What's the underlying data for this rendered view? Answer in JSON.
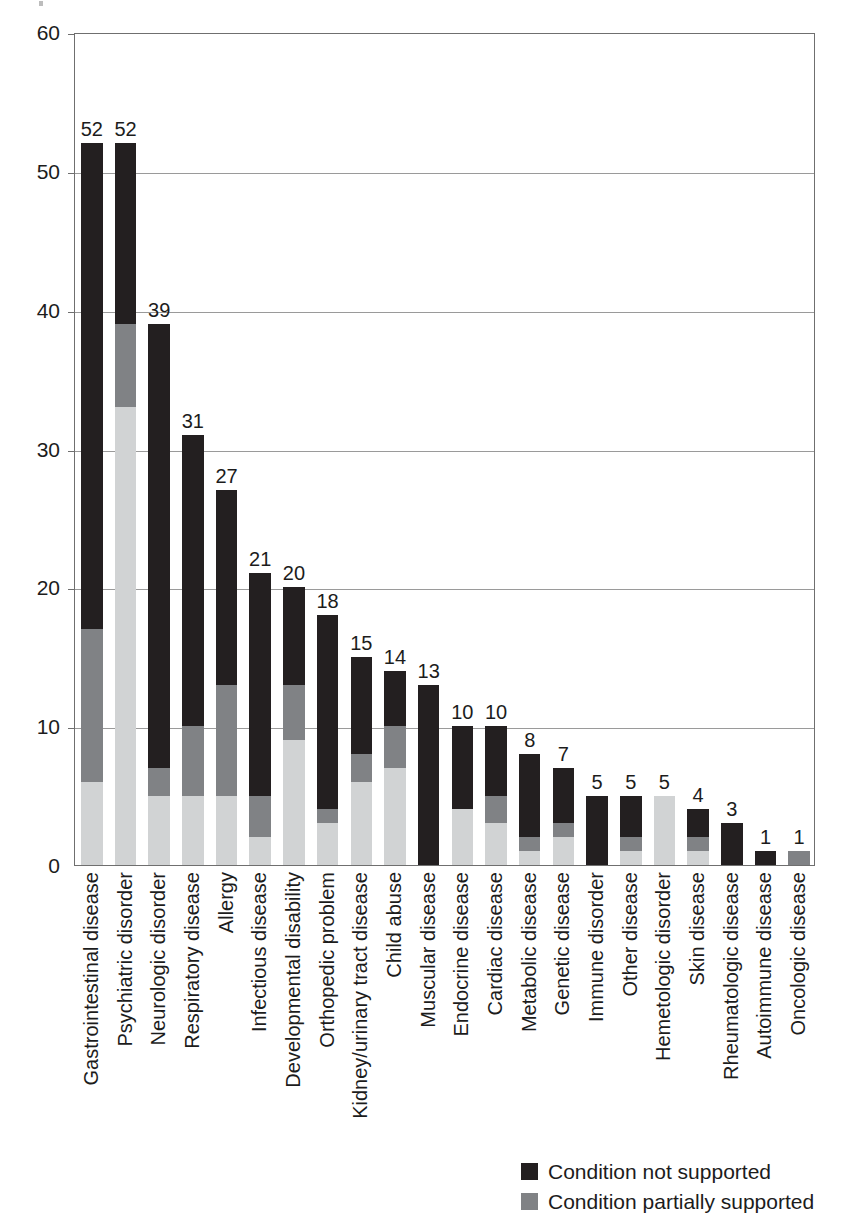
{
  "chart_data": {
    "type": "bar",
    "subtype": "stacked-bar-vertical",
    "title": "",
    "xlabel": "",
    "ylabel": "",
    "ylim": [
      0,
      60
    ],
    "yticks": [
      0,
      10,
      20,
      30,
      40,
      50,
      60
    ],
    "grid": true,
    "legend_position": "bottom-right",
    "colors": {
      "not_supported": "#231f20",
      "partially_supported": "#808285",
      "supported": "#d1d3d4",
      "axis": "#6f6f6f",
      "gridline": "#9a9a9a",
      "text": "#1c1c1c"
    },
    "categories": [
      "Gastrointestinal disease",
      "Psychiatric disorder",
      "Neurologic disorder",
      "Respiratory disease",
      "Allergy",
      "Infectious disease",
      "Developmental disability",
      "Orthopedic problem",
      "Kidney/urinary tract disease",
      "Child abuse",
      "Muscular disease",
      "Endocrine disease",
      "Cardiac disease",
      "Metabolic disease",
      "Genetic disease",
      "Immune disorder",
      "Other disease",
      "Hemetologic disorder",
      "Skin disease",
      "Rheumatologic disease",
      "Autoimmune disease",
      "Oncologic disease"
    ],
    "totals": [
      52,
      52,
      39,
      31,
      27,
      21,
      20,
      18,
      15,
      14,
      13,
      10,
      10,
      8,
      7,
      5,
      5,
      5,
      4,
      3,
      1,
      1
    ],
    "series": [
      {
        "name": "Condition not supported",
        "color": "#231f20",
        "values": [
          35,
          13,
          32,
          21,
          14,
          16,
          7,
          14,
          7,
          4,
          13,
          6,
          5,
          6,
          4,
          5,
          3,
          0,
          2,
          3,
          1,
          0
        ]
      },
      {
        "name": "Condition partially supported",
        "color": "#808285",
        "values": [
          11,
          6,
          2,
          5,
          8,
          3,
          4,
          1,
          2,
          3,
          0,
          0,
          2,
          1,
          1,
          0,
          1,
          0,
          1,
          0,
          0,
          1
        ]
      },
      {
        "name": "Condition supported",
        "color": "#d1d3d4",
        "values": [
          6,
          33,
          5,
          5,
          5,
          2,
          9,
          3,
          6,
          7,
          0,
          4,
          3,
          1,
          2,
          0,
          1,
          5,
          1,
          0,
          0,
          0
        ]
      }
    ]
  },
  "legend": {
    "items": [
      {
        "label": "Condition not supported",
        "swatch": "black"
      },
      {
        "label": "Condition partially supported",
        "swatch": "mid"
      }
    ]
  }
}
